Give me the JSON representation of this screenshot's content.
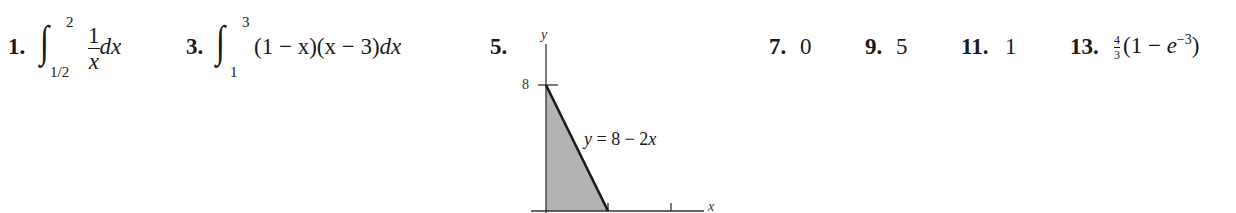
{
  "header_fragment": "",
  "problems": [
    {
      "number": "1.",
      "type": "integral",
      "lower": "1/2",
      "upper": "2",
      "numerator": "1",
      "denominator": "x",
      "differential": "dx"
    },
    {
      "number": "3.",
      "type": "integral",
      "lower": "1",
      "upper": "3",
      "integrand": "(1 − x)(x − 3)",
      "differential": "dx"
    },
    {
      "number": "5.",
      "type": "graph",
      "graph": {
        "y_axis_label": "y",
        "x_axis_label": "x",
        "y_tick_label": "8",
        "curve_label": "y = 8 − 2x",
        "shaded_region": "triangle between y = 8 − 2x, x-axis and y-axis",
        "fill_color": "#b3b3b3",
        "line_color": "#1a1a1a"
      }
    },
    {
      "number": "7.",
      "type": "value",
      "answer": "0"
    },
    {
      "number": "9.",
      "type": "value",
      "answer": "5"
    },
    {
      "number": "11.",
      "type": "value",
      "answer": "1"
    },
    {
      "number": "13.",
      "type": "expression",
      "coef_numerator": "4",
      "coef_denominator": "3",
      "expr_open": "(1 − ",
      "expr_base": "e",
      "expr_exponent": "−3",
      "expr_close": ")"
    }
  ]
}
